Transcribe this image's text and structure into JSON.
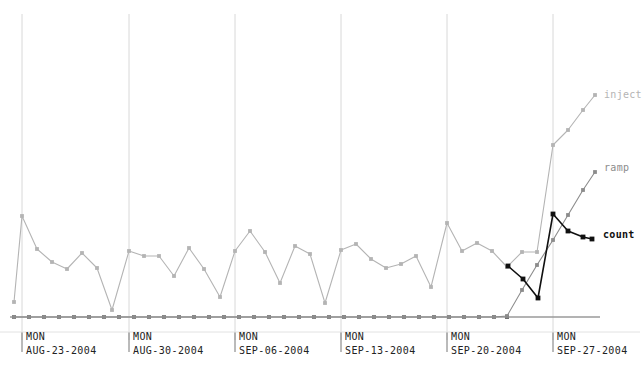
{
  "chart_data": {
    "type": "line",
    "title": "",
    "xlabel": "",
    "ylabel": "",
    "grid": true,
    "grid_orientation": "vertical-weekly",
    "legend_position": "right-inline-at-series-end",
    "xlim": [
      0,
      644
    ],
    "ylim": [
      0,
      376
    ],
    "x_tick_labels": [
      {
        "dow": "MON",
        "date": "AUG-23-2004",
        "x": 22
      },
      {
        "dow": "MON",
        "date": "AUG-30-2004",
        "x": 129
      },
      {
        "dow": "MON",
        "date": "SEP-06-2004",
        "x": 235
      },
      {
        "dow": "MON",
        "date": "SEP-13-2004",
        "x": 341
      },
      {
        "dow": "MON",
        "date": "SEP-20-2004",
        "x": 447
      },
      {
        "dow": "MON",
        "date": "SEP-27-2004",
        "x": 553
      }
    ],
    "gridlines_x": [
      22,
      129,
      235,
      341,
      447,
      553
    ],
    "baseline_y": 317,
    "colors": {
      "inject": "#b4b4b4",
      "ramp": "#8c8c8c",
      "count": "#101010",
      "gridline": "#d8d8d8",
      "axis_tick": "#9a9a9a",
      "text": "#222222"
    },
    "series": [
      {
        "name": "inject",
        "color": "#b4b4b4",
        "label_x": 604,
        "label_y": 95,
        "points": [
          [
            14,
            302
          ],
          [
            22,
            216
          ],
          [
            37,
            249
          ],
          [
            52,
            262
          ],
          [
            67,
            269
          ],
          [
            82,
            253
          ],
          [
            97,
            268
          ],
          [
            112,
            310
          ],
          [
            129,
            251
          ],
          [
            144,
            256
          ],
          [
            159,
            256
          ],
          [
            174,
            276
          ],
          [
            189,
            248
          ],
          [
            204,
            269
          ],
          [
            220,
            297
          ],
          [
            235,
            251
          ],
          [
            250,
            231
          ],
          [
            265,
            252
          ],
          [
            280,
            283
          ],
          [
            295,
            246
          ],
          [
            310,
            254
          ],
          [
            325,
            303
          ],
          [
            341,
            250
          ],
          [
            356,
            244
          ],
          [
            371,
            259
          ],
          [
            386,
            268
          ],
          [
            401,
            264
          ],
          [
            416,
            256
          ],
          [
            431,
            287
          ],
          [
            447,
            223
          ],
          [
            462,
            251
          ],
          [
            477,
            243
          ],
          [
            492,
            251
          ],
          [
            507,
            267
          ],
          [
            522,
            252
          ],
          [
            537,
            252
          ],
          [
            553,
            145
          ],
          [
            568,
            130
          ],
          [
            583,
            110
          ],
          [
            595,
            95
          ]
        ]
      },
      {
        "name": "ramp",
        "color": "#8c8c8c",
        "label_x": 604,
        "label_y": 168,
        "points": [
          [
            14,
            317
          ],
          [
            29,
            317
          ],
          [
            44,
            317
          ],
          [
            59,
            317
          ],
          [
            74,
            317
          ],
          [
            89,
            317
          ],
          [
            104,
            317
          ],
          [
            119,
            317
          ],
          [
            134,
            317
          ],
          [
            149,
            317
          ],
          [
            164,
            317
          ],
          [
            179,
            317
          ],
          [
            194,
            317
          ],
          [
            209,
            317
          ],
          [
            224,
            317
          ],
          [
            239,
            317
          ],
          [
            254,
            317
          ],
          [
            269,
            317
          ],
          [
            284,
            317
          ],
          [
            299,
            317
          ],
          [
            314,
            317
          ],
          [
            329,
            317
          ],
          [
            344,
            317
          ],
          [
            359,
            317
          ],
          [
            374,
            317
          ],
          [
            389,
            317
          ],
          [
            404,
            317
          ],
          [
            419,
            317
          ],
          [
            434,
            317
          ],
          [
            449,
            317
          ],
          [
            464,
            317
          ],
          [
            479,
            317
          ],
          [
            494,
            317
          ],
          [
            507,
            316
          ],
          [
            522,
            290
          ],
          [
            537,
            265
          ],
          [
            553,
            240
          ],
          [
            568,
            215
          ],
          [
            583,
            190
          ],
          [
            595,
            172
          ]
        ]
      },
      {
        "name": "count",
        "color": "#101010",
        "label_x": 603,
        "label_y": 235,
        "points": [
          [
            508,
            266
          ],
          [
            523,
            279
          ],
          [
            538,
            298
          ],
          [
            553,
            214
          ],
          [
            568,
            231
          ],
          [
            583,
            237
          ],
          [
            592,
            239
          ]
        ]
      }
    ],
    "baseline_markers_x": [
      14,
      29,
      44,
      59,
      74,
      89,
      104,
      119,
      134,
      149,
      164,
      179,
      194,
      209,
      224,
      239,
      254,
      269,
      284,
      299,
      314,
      329,
      344,
      359,
      374,
      389,
      404,
      419,
      434,
      449,
      464,
      479,
      494,
      507
    ],
    "legend_entries": [
      {
        "label": "inject",
        "color": "#b4b4b4"
      },
      {
        "label": "ramp",
        "color": "#8c8c8c"
      },
      {
        "label": "count",
        "color": "#101010"
      }
    ]
  }
}
